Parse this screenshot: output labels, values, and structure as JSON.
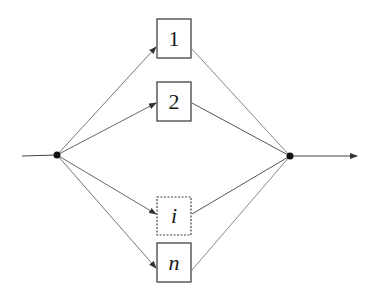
{
  "diagram": {
    "type": "parallel-system",
    "input_node": {
      "x": 57,
      "y": 155
    },
    "output_node": {
      "x": 290,
      "y": 156
    },
    "input_line": {
      "x1": 22,
      "y1": 156
    },
    "output_arrow": {
      "x2": 357,
      "y2": 156
    },
    "components": [
      {
        "id": "1",
        "label": "1",
        "italic": false,
        "dashed": false,
        "x": 157,
        "y": 19,
        "w": 34,
        "h": 39
      },
      {
        "id": "2",
        "label": "2",
        "italic": false,
        "dashed": false,
        "x": 157,
        "y": 82,
        "w": 34,
        "h": 39
      },
      {
        "id": "i",
        "label": "i",
        "italic": true,
        "dashed": true,
        "x": 157,
        "y": 197,
        "w": 34,
        "h": 38
      },
      {
        "id": "n",
        "label": "n",
        "italic": true,
        "dashed": false,
        "x": 157,
        "y": 243,
        "w": 34,
        "h": 39
      }
    ],
    "colors": {
      "line": "#555555",
      "box": "#333333",
      "node": "#111111",
      "background": "#ffffff"
    }
  }
}
